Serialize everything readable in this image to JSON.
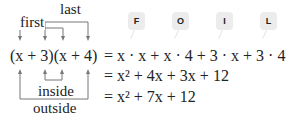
{
  "diagram": {
    "labels": {
      "first": "first",
      "last": "last",
      "inside": "inside",
      "outside": "outside"
    },
    "expression": {
      "lhs": "(x + 3)(x + 4)"
    },
    "foil_badges": [
      "F",
      "O",
      "I",
      "L"
    ],
    "steps": [
      "= x · x + x · 4 + 3 · x + 3 · 4",
      "= x² + 4x + 3x + 12",
      "= x² + 7x + 12"
    ],
    "colors": {
      "badge_bg": "#ececec",
      "arrow": "#666666",
      "text": "#222222"
    }
  }
}
